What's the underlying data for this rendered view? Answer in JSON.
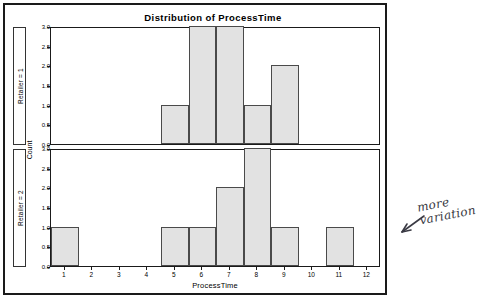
{
  "chart_data": {
    "type": "bar",
    "title": "Distribution of ProcessTime",
    "xlabel": "ProcessTime",
    "ylabel": "Count",
    "xlim": [
      0.5,
      12.5
    ],
    "ylim": [
      0.0,
      3.0
    ],
    "grid": false,
    "legend": null,
    "xticks": [
      "1",
      "2",
      "3",
      "4",
      "5",
      "6",
      "7",
      "8",
      "9",
      "10",
      "11",
      "12"
    ],
    "xtick_values": [
      1,
      2,
      3,
      4,
      5,
      6,
      7,
      8,
      9,
      10,
      11,
      12
    ],
    "yticks": [
      "0.0",
      "0.5",
      "1.0",
      "1.5",
      "2.0",
      "2.5",
      "3.0"
    ],
    "ytick_values": [
      0.0,
      0.5,
      1.0,
      1.5,
      2.0,
      2.5,
      3.0
    ],
    "panels": [
      {
        "strip_label": "Retailer = 1",
        "categories": [
          1,
          2,
          3,
          4,
          5,
          6,
          7,
          8,
          9,
          10,
          11,
          12
        ],
        "values": [
          0,
          0,
          0,
          0,
          1,
          3,
          3,
          1,
          2,
          0,
          0,
          0
        ]
      },
      {
        "strip_label": "Retailer = 2",
        "categories": [
          1,
          2,
          3,
          4,
          5,
          6,
          7,
          8,
          9,
          10,
          11,
          12
        ],
        "values": [
          1,
          0,
          0,
          0,
          1,
          1,
          2,
          3,
          1,
          0,
          1,
          0
        ]
      }
    ]
  },
  "annotation": {
    "text": "more variation",
    "arrow": "left-arrow-icon"
  },
  "colors": {
    "bar_fill": "#e2e2e2",
    "bar_stroke": "#4a4a4a",
    "frame": "#1a1a1a",
    "annotation_ink": "#3a3a44"
  }
}
